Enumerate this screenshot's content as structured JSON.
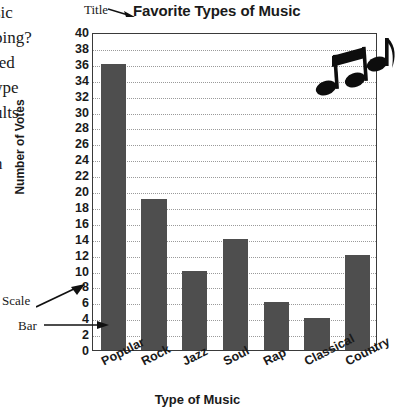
{
  "page": {
    "bleed_text_fragments": [
      "sic",
      "ping?",
      "ted",
      "ype",
      "ults",
      "n"
    ]
  },
  "callouts": {
    "title_label": "Title",
    "scale_label": "Scale",
    "bar_label": "Bar"
  },
  "decorations": {
    "note_pair": "beamed-eighth-notes-icon",
    "note_single": "eighth-note-icon"
  },
  "chart_data": {
    "type": "bar",
    "title": "Favorite Types of Music",
    "xlabel": "Type of Music",
    "ylabel": "Number of Votes",
    "categories": [
      "Popular",
      "Rock",
      "Jazz",
      "Soul",
      "Rap",
      "Classical",
      "Country"
    ],
    "values": [
      36,
      19,
      10,
      14,
      6,
      4,
      12
    ],
    "ylim": [
      0,
      40
    ],
    "ytick_step": 2,
    "yticks": [
      40,
      38,
      36,
      34,
      32,
      30,
      28,
      26,
      24,
      22,
      20,
      18,
      16,
      14,
      12,
      10,
      8,
      6,
      4,
      2,
      0
    ],
    "grid": true,
    "grid_style": "dotted",
    "legend": "none",
    "bar_color": "#4e4e4e",
    "grid_color": "#9a9a9a",
    "axis_color": "#3a3a3a"
  }
}
